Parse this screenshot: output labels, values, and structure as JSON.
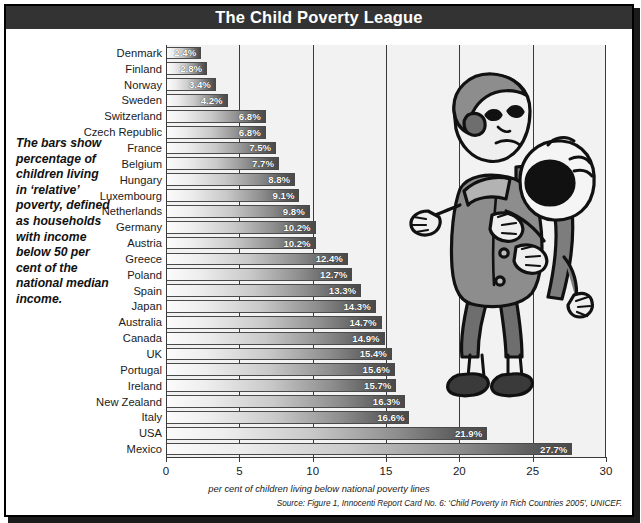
{
  "header": {
    "title": "The Child Poverty League"
  },
  "caption": {
    "text": "The bars show percentage of children living in ‘relative’ poverty, defined as households with income below 50 per cent of the national median income."
  },
  "footer": {
    "axis_title": "per cent of children living below national poverty lines",
    "source": "Source: Figure 1, Innocenti Report Card No. 6: ‘Child Poverty in Rich Countries 2005’, UNICEF."
  },
  "illustration": {
    "name": "child-carrying-crying-baby-illustration"
  },
  "colors": {
    "titlebar": "#333333",
    "plot_background": "#f2f2f2",
    "bar_dark": "#4a4a4a",
    "bar_light": "#fbfbfb",
    "gridline": "#3a3a3a",
    "frame": "#000000"
  },
  "chart_data": {
    "type": "bar",
    "orientation": "horizontal",
    "title": "The Child Poverty League",
    "xlabel": "per cent of children living below national poverty lines",
    "ylabel": "",
    "xlim": [
      0,
      30
    ],
    "xticks": [
      0,
      5,
      10,
      15,
      20,
      25,
      30
    ],
    "grid": true,
    "legend": false,
    "value_suffix": "%",
    "categories": [
      "Denmark",
      "Finland",
      "Norway",
      "Sweden",
      "Switzerland",
      "Czech Republic",
      "France",
      "Belgium",
      "Hungary",
      "Luxembourg",
      "Netherlands",
      "Germany",
      "Austria",
      "Greece",
      "Poland",
      "Spain",
      "Japan",
      "Australia",
      "Canada",
      "UK",
      "Portugal",
      "Ireland",
      "New Zealand",
      "Italy",
      "USA",
      "Mexico"
    ],
    "values": [
      2.4,
      2.8,
      3.4,
      4.2,
      6.8,
      6.8,
      7.5,
      7.7,
      8.8,
      9.1,
      9.8,
      10.2,
      10.2,
      12.4,
      12.7,
      13.3,
      14.3,
      14.7,
      14.9,
      15.4,
      15.6,
      15.7,
      16.3,
      16.6,
      21.9,
      27.7
    ],
    "labels": [
      "2.4%",
      "2.8%",
      "3.4%",
      "4.2%",
      "6.8%",
      "6.8%",
      "7.5%",
      "7.7%",
      "8.8%",
      "9.1%",
      "9.8%",
      "10.2%",
      "10.2%",
      "12.4%",
      "12.7%",
      "13.3%",
      "14.3%",
      "14.7%",
      "14.9%",
      "15.4%",
      "15.6%",
      "15.7%",
      "16.3%",
      "16.6%",
      "21.9%",
      "27.7%"
    ]
  }
}
